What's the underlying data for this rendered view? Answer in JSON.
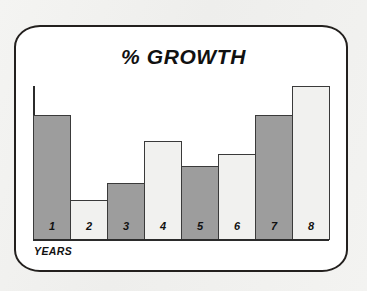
{
  "figure": {
    "frame_style": "rounded-tv-screen",
    "frame_border_color": "#23201e",
    "paper_color": "#f2f2f0",
    "screen_color": "#ffffff"
  },
  "chart_data": {
    "type": "bar",
    "title": "% GROWTH",
    "xlabel": "YEARS",
    "ylabel": "",
    "categories": [
      "1",
      "2",
      "3",
      "4",
      "5",
      "6",
      "7",
      "8"
    ],
    "values": [
      81,
      26,
      37,
      64,
      48,
      56,
      81,
      100
    ],
    "ylim": [
      0,
      100
    ],
    "grid": false,
    "legend": null,
    "axis_color": "#2b2b2b",
    "bar_border_color": "#3a3a3a",
    "bars": [
      {
        "category": "1",
        "value": 81,
        "fill": "dark",
        "color": "#9d9d9d"
      },
      {
        "category": "2",
        "value": 26,
        "fill": "light",
        "color": "#f1f1ef"
      },
      {
        "category": "3",
        "value": 37,
        "fill": "dark",
        "color": "#9d9d9d"
      },
      {
        "category": "4",
        "value": 64,
        "fill": "light",
        "color": "#f1f1ef"
      },
      {
        "category": "5",
        "value": 48,
        "fill": "dark",
        "color": "#9d9d9d"
      },
      {
        "category": "6",
        "value": 56,
        "fill": "light",
        "color": "#f1f1ef"
      },
      {
        "category": "7",
        "value": 81,
        "fill": "dark",
        "color": "#9d9d9d"
      },
      {
        "category": "8",
        "value": 100,
        "fill": "light",
        "color": "#f1f1ef"
      }
    ]
  }
}
